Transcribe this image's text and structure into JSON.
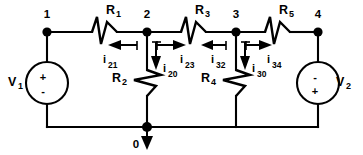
{
  "diagram": {
    "background_color": "#ffffff",
    "line_color": "#000000"
  },
  "nodes": [
    {
      "id": "node-1",
      "label": "1",
      "x": 47,
      "y": 32
    },
    {
      "id": "node-2",
      "label": "2",
      "x": 147,
      "y": 32
    },
    {
      "id": "node-3",
      "label": "3",
      "x": 236,
      "y": 32
    },
    {
      "id": "node-4",
      "label": "4",
      "x": 318,
      "y": 32
    },
    {
      "id": "node-0",
      "label": "0",
      "x": 147,
      "y": 127
    }
  ],
  "resistors": [
    {
      "id": "R1",
      "label": "R",
      "sub": "1",
      "orientation": "horizontal"
    },
    {
      "id": "R2",
      "label": "R",
      "sub": "2",
      "orientation": "vertical"
    },
    {
      "id": "R3",
      "label": "R",
      "sub": "3",
      "orientation": "horizontal"
    },
    {
      "id": "R4",
      "label": "R",
      "sub": "4",
      "orientation": "vertical"
    },
    {
      "id": "R5",
      "label": "R",
      "sub": "5",
      "orientation": "horizontal"
    }
  ],
  "sources": [
    {
      "id": "V1",
      "label": "V",
      "sub": "1",
      "top_sign": "+",
      "bottom_sign": "-",
      "x": 47,
      "y": 83
    },
    {
      "id": "V2",
      "label": "V",
      "sub": "2",
      "top_sign": "-",
      "bottom_sign": "+",
      "x": 318,
      "y": 83
    }
  ],
  "currents": [
    {
      "id": "i21",
      "label": "i",
      "sub": "21",
      "direction": "left"
    },
    {
      "id": "i20",
      "label": "i",
      "sub": "20",
      "direction": "down"
    },
    {
      "id": "i23",
      "label": "i",
      "sub": "23",
      "direction": "right"
    },
    {
      "id": "i32",
      "label": "i",
      "sub": "32",
      "direction": "left"
    },
    {
      "id": "i30",
      "label": "i",
      "sub": "30",
      "direction": "down"
    },
    {
      "id": "i34",
      "label": "i",
      "sub": "34",
      "direction": "right"
    }
  ],
  "ground": {
    "id": "ground-arrow",
    "node_label": "0",
    "direction": "down"
  }
}
